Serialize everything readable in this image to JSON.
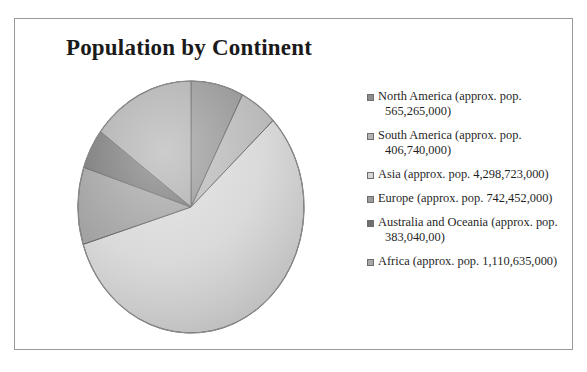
{
  "chart_data": {
    "type": "pie",
    "title": "Population by Continent",
    "legend_position": "right",
    "categories": [
      "North America (approx. pop. 565,265,000)",
      "South America (approx. pop. 406,740,000)",
      "Asia (approx. pop. 4,298,723,000)",
      "Europe (approx. pop. 742,452,000)",
      "Australia and Oceania (approx. pop. 383,040,00)",
      "Africa (approx. pop. 1,110,635,000)"
    ],
    "short_names": [
      "North America",
      "South America",
      "Asia",
      "Europe",
      "Australia and Oceania",
      "Africa"
    ],
    "values": [
      565265000,
      406740000,
      4298723000,
      742452000,
      383040000,
      1110635000
    ],
    "value_labels": [
      "565,265,000",
      "406,740,000",
      "4,298,723,000",
      "742,452,000",
      "383,040,00",
      "1,110,635,000"
    ],
    "percentages": [
      7.5,
      5.4,
      57.3,
      9.9,
      5.1,
      14.8
    ],
    "total": 7506855000,
    "unit": "people",
    "start_angle_deg": 0,
    "direction": "clockwise",
    "colors": [
      "#8e8e8e",
      "#b4b4b4",
      "#d6d6d6",
      "#9c9c9c",
      "#6f6f6f",
      "#a8a8a8"
    ],
    "slice_edge_color": "#5a5a5a",
    "style": "3d-bevel-grayscale"
  },
  "legend": {
    "items": [
      {
        "marker": "legend-swatch-north-america",
        "label": "North America (approx. pop. 565,265,000)"
      },
      {
        "marker": "legend-swatch-south-america",
        "label": "South America (approx. pop. 406,740,000)"
      },
      {
        "marker": "legend-swatch-asia",
        "label": "Asia (approx. pop. 4,298,723,000)"
      },
      {
        "marker": "legend-swatch-europe",
        "label": "Europe (approx. pop. 742,452,000)"
      },
      {
        "marker": "legend-swatch-australia-oceania",
        "label": "Australia and Oceania (approx. pop. 383,040,00)"
      },
      {
        "marker": "legend-swatch-africa",
        "label": "Africa (approx. pop. 1,110,635,000)"
      }
    ]
  },
  "colors": {
    "page_background": "#ffffff",
    "frame_border": "#9a9a9a",
    "title_text": "#1a1a1a",
    "legend_text": "#1f1f1f"
  }
}
